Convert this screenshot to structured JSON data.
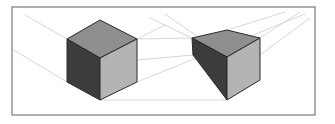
{
  "diagram": {
    "frame": {
      "x": 12,
      "y": 7,
      "width": 303,
      "height": 108,
      "stroke": "#7a7a7a"
    },
    "colors": {
      "top_face": "#8e8e8e",
      "left_face": "#3c3c3c",
      "right_face": "#b4b4b4",
      "edge": "#2a2a2a",
      "guide_line": "#d4d4d4"
    },
    "shapes": [
      {
        "name": "cube",
        "top": "100,20 137,39 100,58 67,39",
        "left": "67,39 100,58 100,100 67,82",
        "right": "100,58 137,39 137,82 100,100"
      },
      {
        "name": "tapered-box",
        "top": "227,30 260,38 227,57 192,38",
        "left": "192,38 227,57 227,100 193,55",
        "right": "227,57 260,38 260,80 227,100"
      }
    ]
  }
}
